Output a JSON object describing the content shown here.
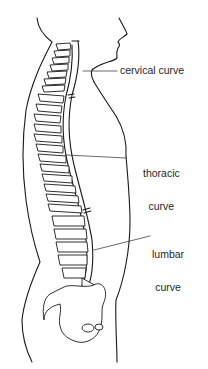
{
  "diagram": {
    "labels": [
      {
        "id": "cervical",
        "text": "cervical curve"
      },
      {
        "id": "thoracic",
        "line1": "thoracic",
        "line2": "curve"
      },
      {
        "id": "lumbar",
        "line1": "lumbar",
        "line2": "curve"
      }
    ],
    "colors": {
      "line": "#1a1a1a",
      "background": "#ffffff"
    }
  }
}
